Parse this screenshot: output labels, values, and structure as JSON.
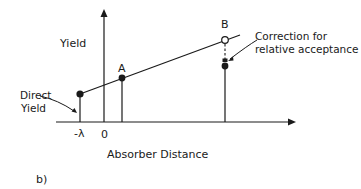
{
  "figure": {
    "panel_label": "b)",
    "y_axis_label": "Yield",
    "x_axis_label": "Absorber Distance",
    "x_ticks": [
      "-λ",
      "0"
    ],
    "points": {
      "direct": {
        "label_line1": "Direct",
        "label_line2": "Yield"
      },
      "a": {
        "label": "A"
      },
      "b": {
        "label": "B"
      }
    },
    "annotation": {
      "line1": "Correction for",
      "line2": "relative acceptance"
    },
    "colors": {
      "ink": "#1a1a1a",
      "background": "#ffffff"
    }
  }
}
